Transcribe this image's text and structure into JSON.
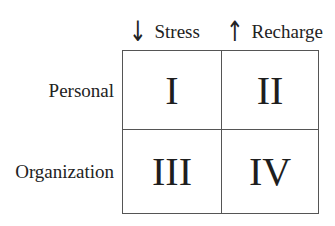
{
  "columns": [
    {
      "arrow_icon": "↓",
      "icon_name": "arrow-down-icon",
      "label": "Stress"
    },
    {
      "arrow_icon": "↑",
      "icon_name": "arrow-up-icon",
      "label": "Recharge"
    }
  ],
  "rows": [
    {
      "label": "Personal"
    },
    {
      "label": "Organization"
    }
  ],
  "cells": [
    {
      "numeral": "I"
    },
    {
      "numeral": "II"
    },
    {
      "numeral": "III"
    },
    {
      "numeral": "IV"
    }
  ],
  "colors": {
    "text": "#222222",
    "border": "#555555",
    "background": "#ffffff"
  }
}
